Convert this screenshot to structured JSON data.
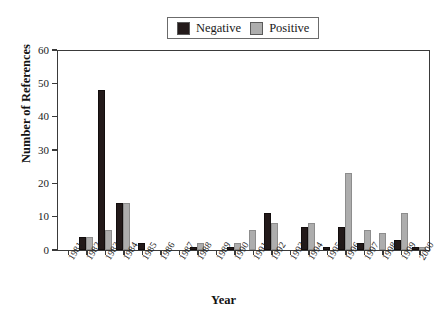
{
  "chart_data": {
    "type": "bar",
    "title": "",
    "subtitle": "",
    "xlabel": "Year",
    "ylabel": "Number of References",
    "xlim_categories": 20,
    "ylim": [
      0,
      60
    ],
    "yticks": [
      0,
      10,
      20,
      30,
      40,
      50,
      60
    ],
    "grid": false,
    "legend_position": "top-center",
    "categories": [
      "1981",
      "1982",
      "1983",
      "1984",
      "1985",
      "1986",
      "1987",
      "1988",
      "1989",
      "1990",
      "1991",
      "1992",
      "1993",
      "1994",
      "1995",
      "1996",
      "1997",
      "1998",
      "1999",
      "2000"
    ],
    "series": [
      {
        "name": "Negative",
        "color": "#231a1a",
        "values": [
          0,
          4,
          48,
          14,
          2,
          0,
          0,
          1,
          0,
          1,
          0,
          11,
          0,
          7,
          1,
          7,
          2,
          0,
          3,
          1
        ]
      },
      {
        "name": "Positive",
        "color": "#adadad",
        "values": [
          0,
          4,
          6,
          14,
          0,
          0,
          0,
          2,
          0,
          2,
          6,
          8,
          0,
          8,
          0,
          23,
          6,
          5,
          11,
          1
        ]
      }
    ]
  },
  "legend": {
    "entries": [
      {
        "label": "Negative",
        "swatch": "legend-swatch-negative"
      },
      {
        "label": "Positive",
        "swatch": "legend-swatch-positive"
      }
    ]
  },
  "axes": {
    "y_title": "Number of References",
    "x_title": "Year"
  },
  "colors": {
    "negative": "#231a1a",
    "positive": "#adadad",
    "axis": "#3a3a3a",
    "text": "#1a1a1a",
    "background": "#ffffff"
  }
}
